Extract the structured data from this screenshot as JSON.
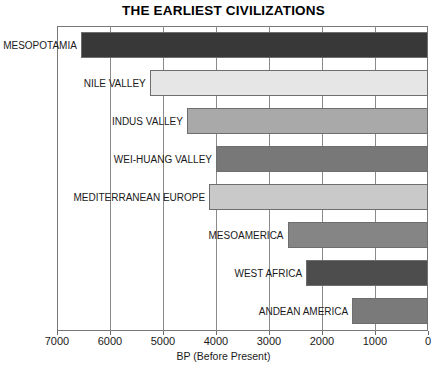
{
  "chart_data": {
    "type": "bar",
    "orientation": "horizontal",
    "title": "THE EARLIEST CIVILIZATIONS",
    "xlabel": "BP (Before Present)",
    "ylabel": "",
    "xlim": [
      7000,
      0
    ],
    "xticks": [
      7000,
      6000,
      5000,
      4000,
      3000,
      2000,
      1000,
      0
    ],
    "xtick_labels": [
      "7000",
      "6000",
      "5000",
      "4000",
      "3000",
      "2000",
      "1000",
      "0"
    ],
    "grid": true,
    "legend": false,
    "note": "Each bar spans from the civilization's start date (BP) to 0 BP (present).",
    "categories": [
      "MESOPOTAMIA",
      "NILE VALLEY",
      "INDUS VALLEY",
      "WEI-HUANG VALLEY",
      "MEDITERRANEAN EUROPE",
      "MESOAMERICA",
      "WEST AFRICA",
      "ANDEAN AMERICA"
    ],
    "values": [
      6550,
      5250,
      4550,
      4000,
      4130,
      2650,
      2300,
      1430
    ],
    "bars": [
      {
        "label": "MESOPOTAMIA",
        "start_bp": 6550,
        "end_bp": 0,
        "color": "#383838"
      },
      {
        "label": "NILE VALLEY",
        "start_bp": 5250,
        "end_bp": 0,
        "color": "#e6e6e6"
      },
      {
        "label": "INDUS VALLEY",
        "start_bp": 4550,
        "end_bp": 0,
        "color": "#a9a9a9"
      },
      {
        "label": "WEI-HUANG VALLEY",
        "start_bp": 4000,
        "end_bp": 0,
        "color": "#787878"
      },
      {
        "label": "MEDITERRANEAN EUROPE",
        "start_bp": 4130,
        "end_bp": 0,
        "color": "#c9c9c9"
      },
      {
        "label": "MESOAMERICA",
        "start_bp": 2650,
        "end_bp": 0,
        "color": "#858585"
      },
      {
        "label": "WEST AFRICA",
        "start_bp": 2300,
        "end_bp": 0,
        "color": "#4d4d4d"
      },
      {
        "label": "ANDEAN AMERICA",
        "start_bp": 1430,
        "end_bp": 0,
        "color": "#7a7a7a"
      }
    ]
  }
}
